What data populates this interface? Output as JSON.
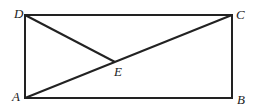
{
  "diagram": {
    "type": "geometry",
    "points": {
      "A": {
        "label": "A",
        "x": 25,
        "y": 98
      },
      "B": {
        "label": "B",
        "x": 232,
        "y": 98
      },
      "C": {
        "label": "C",
        "x": 232,
        "y": 15
      },
      "D": {
        "label": "D",
        "x": 25,
        "y": 15
      },
      "E": {
        "label": "E",
        "x": 115,
        "y": 62
      }
    },
    "segments": [
      "AB",
      "BC",
      "CD",
      "DA",
      "AC",
      "DE"
    ]
  }
}
